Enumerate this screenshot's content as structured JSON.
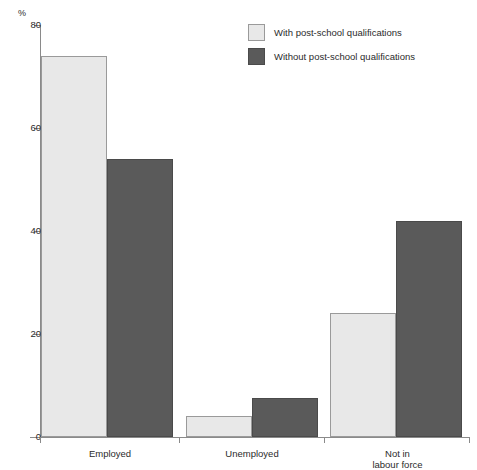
{
  "chart_data": {
    "type": "bar",
    "title": "",
    "xlabel": "",
    "ylabel": "%",
    "ylim": [
      0,
      80
    ],
    "yticks": [
      0,
      20,
      40,
      60,
      80
    ],
    "grid": false,
    "legend_position": "top-right",
    "categories": [
      "Employed",
      "Unemployed",
      "Not in\nlabour force"
    ],
    "series": [
      {
        "name": "With post-school qualifications",
        "color": "#e8e8e8",
        "values": [
          74,
          4,
          24
        ]
      },
      {
        "name": "Without post-school qualifications",
        "color": "#5a5a5a",
        "values": [
          54,
          7.5,
          42
        ]
      }
    ]
  },
  "axis": {
    "unit_label": "%",
    "tick_labels": [
      "80",
      "60",
      "40",
      "20",
      "0"
    ]
  },
  "categories_display": [
    {
      "line1": "Employed",
      "line2": ""
    },
    {
      "line1": "Unemployed",
      "line2": ""
    },
    {
      "line1": "Not in",
      "line2": "labour force"
    }
  ],
  "legend": {
    "items": [
      {
        "label": "With post-school qualifications",
        "swatch": "light"
      },
      {
        "label": "Without post-school qualifications",
        "swatch": "dark"
      }
    ]
  },
  "title_fragment": ""
}
